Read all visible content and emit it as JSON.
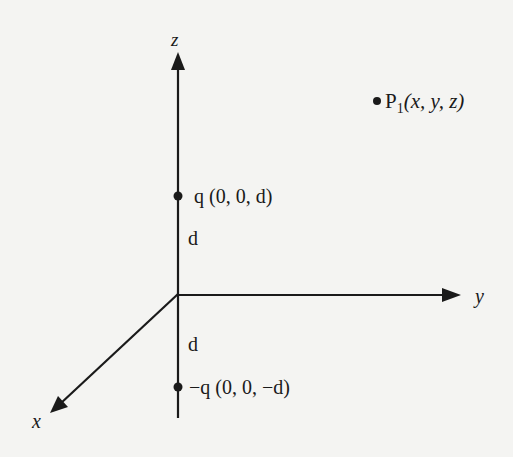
{
  "diagram": {
    "type": "3d-coordinate-axes-with-charges",
    "axes": {
      "z": {
        "label": "z"
      },
      "y": {
        "label": "y"
      },
      "x": {
        "label": "x"
      }
    },
    "points": {
      "p1": {
        "name": "P",
        "subscript": "1",
        "coords": "(x, y, z)"
      },
      "q_pos": {
        "label": "q (0, 0, d)"
      },
      "q_neg": {
        "label": "−q (0, 0, −d)"
      }
    },
    "distances": {
      "upper": "d",
      "lower": "d"
    },
    "colors": {
      "ink": "#1a1a1a",
      "background": "#f4f4f2"
    }
  }
}
